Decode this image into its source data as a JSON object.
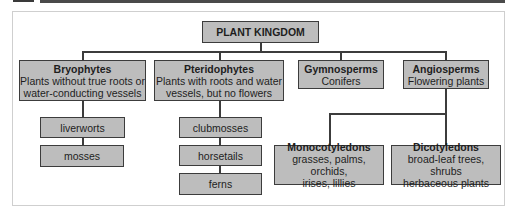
{
  "diagram": {
    "root": {
      "title": "PLANT KINGDOM"
    },
    "groups": [
      {
        "title": "Bryophytes",
        "desc_lines": [
          "Plants without true roots or",
          "water-conducting vessels"
        ],
        "children": [
          "liverworts",
          "mosses"
        ]
      },
      {
        "title": "Pteridophytes",
        "desc_lines": [
          "Plants with roots and water",
          "vessels, but no flowers"
        ],
        "children": [
          "clubmosses",
          "horsetails",
          "ferns"
        ]
      },
      {
        "title": "Gymnosperms",
        "desc_lines": [
          "Conifers"
        ],
        "children": []
      },
      {
        "title": "Angiosperms",
        "desc_lines": [
          "Flowering plants"
        ],
        "children": [
          {
            "title": "Monocotyledons",
            "desc_lines": [
              "grasses, palms, orchids,",
              "irises, lillies"
            ]
          },
          {
            "title": "Dicotyledons",
            "desc_lines": [
              "broad-leaf trees, shrubs",
              "herbaceous plants"
            ]
          }
        ]
      }
    ]
  },
  "colors": {
    "box_fill": "#bdbdbd",
    "box_border": "#3c3c3c",
    "line": "#3c3c3c",
    "topbar": "#4a4a4a"
  }
}
